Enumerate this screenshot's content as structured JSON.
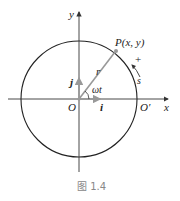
{
  "figure": {
    "caption": "图 1.4",
    "labels": {
      "y_axis": "y",
      "x_axis": "x",
      "origin": "O",
      "o_prime": "O′",
      "point": "P(x, y)",
      "radius": "r",
      "angle": "ωt",
      "unit_i": "i",
      "unit_j": "j",
      "arc": "s",
      "direction": "+"
    },
    "colors": {
      "axes": "#333333",
      "circle": "#222222",
      "radius_vector": "#999999",
      "caption": "#888888"
    }
  }
}
